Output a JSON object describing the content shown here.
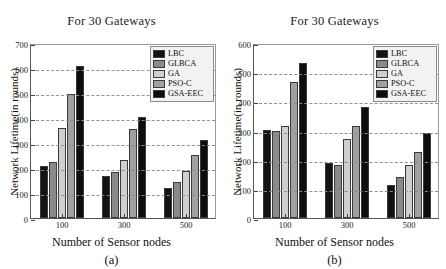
{
  "xlabel": "Number of Sensor nodes",
  "ylabel": "Network Lifetime(in rounds)",
  "series_colors": {
    "LBC": "#131313",
    "GLBCA": "#8a8a8a",
    "GA": "#cfcfcf",
    "PSO-C": "#a0a0a0",
    "GSA-EEC": "#0d0d0d"
  },
  "panels": [
    {
      "caption": "(a)",
      "title": "For 30 Gateways",
      "chart_data": {
        "type": "bar",
        "title": "For 30 Gateways",
        "xlabel": "Number of Sensor nodes",
        "ylabel": "Network Lifetime(in rounds)",
        "categories": [
          "100",
          "300",
          "500"
        ],
        "ylim": [
          0,
          700
        ],
        "yticks": [
          0,
          100,
          200,
          300,
          400,
          500,
          600,
          700
        ],
        "grid": true,
        "legend": "top-right",
        "series": [
          {
            "name": "LBC",
            "values": [
              210,
              170,
              120
            ]
          },
          {
            "name": "GLBCA",
            "values": [
              223,
              185,
              145
            ]
          },
          {
            "name": "GA",
            "values": [
              362,
              232,
              190
            ]
          },
          {
            "name": "PSO-C",
            "values": [
              498,
              355,
              253
            ]
          },
          {
            "name": "GSA-EEC",
            "values": [
              610,
              403,
              312
            ]
          }
        ]
      }
    },
    {
      "caption": "(b)",
      "title": "For 30 Gateways",
      "chart_data": {
        "type": "bar",
        "title": "For 30 Gateways",
        "xlabel": "Number of Sensor nodes",
        "ylabel": "Network Lifetime(in rounds)",
        "categories": [
          "100",
          "300",
          "500"
        ],
        "ylim": [
          0,
          600
        ],
        "yticks": [
          0,
          100,
          200,
          300,
          400,
          500,
          600
        ],
        "grid": true,
        "legend": "top-right",
        "series": [
          {
            "name": "LBC",
            "values": [
              303,
              188,
              112
            ]
          },
          {
            "name": "GLBCA",
            "values": [
              297,
              182,
              142
            ]
          },
          {
            "name": "GA",
            "values": [
              315,
              272,
              182
            ]
          },
          {
            "name": "PSO-C",
            "values": [
              468,
              316,
              225
            ]
          },
          {
            "name": "GSA-EEC",
            "values": [
              532,
              380,
              291
            ]
          }
        ]
      }
    }
  ]
}
